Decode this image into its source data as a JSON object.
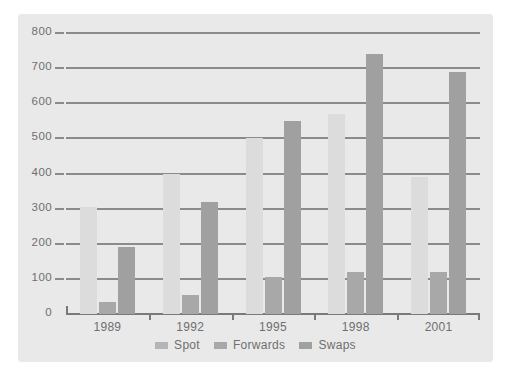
{
  "chart_data": {
    "type": "bar",
    "title": "",
    "subtitle": "",
    "xlabel": "",
    "ylabel": "",
    "categories": [
      "1989",
      "1992",
      "1995",
      "1998",
      "2001"
    ],
    "series": [
      {
        "name": "Spot",
        "color": "#dcdcdc",
        "values": [
          305,
          400,
          500,
          570,
          390
        ]
      },
      {
        "name": "Forwards",
        "color": "#a8a8a8",
        "values": [
          35,
          55,
          105,
          120,
          120
        ]
      },
      {
        "name": "Swaps",
        "color": "#a0a0a0",
        "values": [
          190,
          320,
          550,
          740,
          690
        ]
      }
    ],
    "ylim": [
      0,
      800
    ],
    "ytick_labels": [
      "0",
      "100",
      "200",
      "300",
      "400",
      "500",
      "600",
      "700",
      "800"
    ],
    "ytick_values": [
      0,
      100,
      200,
      300,
      400,
      500,
      600,
      700,
      800
    ],
    "grid": true,
    "grid_color": "#8b8b8b",
    "legend_position": "bottom",
    "panel_color": "#e9e9e9",
    "background_color": "#ffffff",
    "axis_color": "#7a7a7a",
    "text_color": "#6f6f6f"
  }
}
